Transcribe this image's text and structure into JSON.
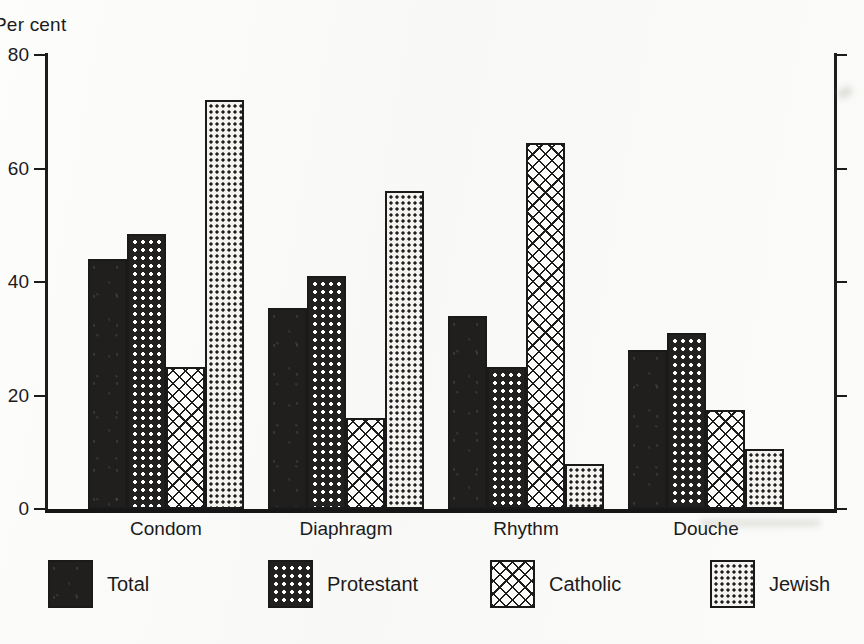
{
  "chart_data": {
    "type": "bar",
    "title": "",
    "xlabel": "",
    "ylabel": "Per cent",
    "ylim": [
      0,
      80
    ],
    "yticks": [
      0,
      20,
      40,
      60,
      80
    ],
    "grid": false,
    "legend_position": "bottom",
    "categories": [
      "Condom",
      "Diaphragm",
      "Rhythm",
      "Douche"
    ],
    "series": [
      {
        "name": "Total",
        "pattern": "solid-black",
        "values": [
          44,
          35.5,
          34,
          28
        ]
      },
      {
        "name": "Protestant",
        "pattern": "dark-dot-grid",
        "values": [
          48.5,
          41,
          25,
          31
        ]
      },
      {
        "name": "Catholic",
        "pattern": "diagonal-crosshatch",
        "values": [
          25,
          16,
          64.5,
          17.5
        ]
      },
      {
        "name": "Jewish",
        "pattern": "fine-dot-stipple",
        "values": [
          72,
          56,
          8,
          10.5
        ]
      }
    ]
  },
  "axis": {
    "y_title": "Per cent",
    "y_tick_labels": [
      "80",
      "60",
      "40",
      "20",
      "0"
    ]
  },
  "legend": {
    "items": [
      {
        "label": "Total"
      },
      {
        "label": "Protestant"
      },
      {
        "label": "Catholic"
      },
      {
        "label": "Jewish"
      }
    ]
  },
  "colors": {
    "ink": "#1c1c1c",
    "paper": "#fbfbf9",
    "bar_dark": "#211f1e",
    "bar_light": "#f4f3f0"
  }
}
